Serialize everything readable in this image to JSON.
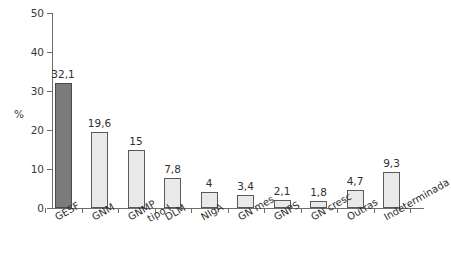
{
  "chart_data": {
    "type": "bar",
    "title": "",
    "subtitle": "",
    "xlabel": "",
    "ylabel": "%",
    "ylim": [
      0,
      50
    ],
    "yticks": [
      0,
      10,
      20,
      30,
      40,
      50
    ],
    "ytick_labels": [
      "0",
      "10",
      "20",
      "30",
      "40",
      "50"
    ],
    "grid": false,
    "legend": null,
    "categories": [
      "GESF",
      "GNM",
      "GNMP tipo I",
      "DLM",
      "NIgA",
      "GN mes",
      "GNPS",
      "GN cresc",
      "Outras",
      "Indeterminada"
    ],
    "values": [
      32.1,
      19.6,
      15,
      7.8,
      4,
      3.4,
      2.1,
      1.8,
      4.7,
      9.3
    ],
    "data_labels": [
      "32,1",
      "19,6",
      "15",
      "7,8",
      "4",
      "3,4",
      "2,1",
      "1,8",
      "4,7",
      "9,3"
    ],
    "bar_colors": [
      "#7b7b7b",
      "#e9e9e9",
      "#e9e9e9",
      "#e9e9e9",
      "#e9e9e9",
      "#e9e9e9",
      "#e9e9e9",
      "#e9e9e9",
      "#e9e9e9",
      "#e9e9e9"
    ],
    "bar_edge_color": "#5a5a5a",
    "axis_color": "#6e6e6e",
    "background": "#ffffff"
  },
  "axis": {
    "y_title": "%"
  }
}
